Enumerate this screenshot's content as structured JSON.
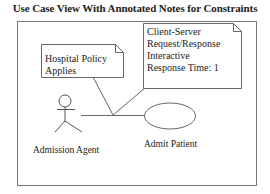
{
  "title": "Use Case View With Annotated Notes for Constraints",
  "diagram": {
    "type": "uml-use-case",
    "actor": {
      "label": "Admission Agent"
    },
    "use_case": {
      "label": "Admit Patient"
    },
    "notes": [
      {
        "lines": [
          "Hospital Policy",
          "Applies"
        ]
      },
      {
        "lines": [
          "Client-Server",
          "Request/Response",
          "Interactive",
          "Response Time: 1"
        ]
      }
    ]
  },
  "colors": {
    "line": "#555555",
    "text": "#222222",
    "background": "#ffffff"
  }
}
